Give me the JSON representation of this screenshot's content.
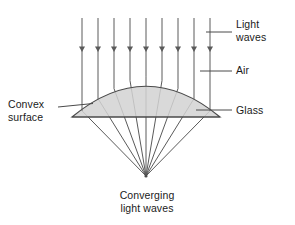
{
  "figure": {
    "labels": {
      "light_waves": "Light\nwaves",
      "air": "Air",
      "glass": "Glass",
      "convex_surface": "Convex\nsurface",
      "converging": "Converging\nlight waves"
    },
    "colors": {
      "background": "#ffffff",
      "lens_fill": "#d2d2d2",
      "stroke": "#4a4a4a",
      "ray_stroke": "#5a5a5a",
      "text": "#1a1a1a"
    },
    "geometry": {
      "incoming_ray_count": 9,
      "ray_x_positions": [
        82,
        98,
        114,
        130,
        146,
        162,
        178,
        194,
        210
      ],
      "ray_top_y": 18,
      "arrowhead_y": 50,
      "focal_point": {
        "x": 146,
        "y": 176
      },
      "lens": {
        "flat_bottom_y": 117,
        "left_x": 72,
        "right_x": 200,
        "apex_x": 146,
        "apex_y": 76
      },
      "leader_lines": [
        {
          "name": "light-waves-leader",
          "x1": 210,
          "y1": 32,
          "x2": 232,
          "y2": 32
        },
        {
          "name": "air-leader",
          "x1": 204,
          "y1": 71,
          "x2": 232,
          "y2": 71
        },
        {
          "name": "glass-leader",
          "x1": 196,
          "y1": 110,
          "x2": 232,
          "y2": 110
        },
        {
          "name": "convex-surface-leader",
          "x1": 60,
          "y1": 107,
          "x2": 92,
          "y2": 104
        }
      ]
    }
  }
}
